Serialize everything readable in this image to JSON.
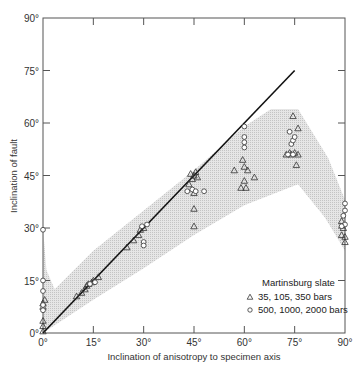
{
  "chart_data": {
    "type": "scatter",
    "title": "",
    "xlabel": "Inclination of anisotropy to specimen axis",
    "ylabel": "Inclination of fault",
    "xlim": [
      0,
      90
    ],
    "ylim": [
      0,
      90
    ],
    "grid": false,
    "x_ticks": [
      "0°",
      "15°",
      "30°",
      "45°",
      "60°",
      "75°",
      "90°"
    ],
    "y_ticks": [
      "0°",
      "15°",
      "30°",
      "45°",
      "60°",
      "75°",
      "90°"
    ],
    "legend": {
      "title": "Martinsburg slate",
      "position": "lower right",
      "entries": [
        {
          "marker": "triangle",
          "label": "35, 105, 350 bars"
        },
        {
          "marker": "circle",
          "label": "500, 1000, 2000 bars"
        }
      ]
    },
    "reference_line": {
      "name": "fault = anisotropy",
      "x": [
        0,
        75
      ],
      "y": [
        0,
        75
      ]
    },
    "shaded_band": {
      "upper": [
        [
          0,
          30
        ],
        [
          1,
          18
        ],
        [
          3.5,
          12.5
        ],
        [
          15,
          23.5
        ],
        [
          30,
          35
        ],
        [
          45,
          46.5
        ],
        [
          60,
          59
        ],
        [
          68,
          64
        ],
        [
          76,
          64
        ],
        [
          85,
          50
        ],
        [
          90,
          38
        ]
      ],
      "lower": [
        [
          90,
          23.5
        ],
        [
          84,
          33
        ],
        [
          76,
          42.5
        ],
        [
          60,
          36.5
        ],
        [
          45,
          28
        ],
        [
          30,
          18.5
        ],
        [
          15,
          9.5
        ],
        [
          0,
          0
        ]
      ]
    },
    "series": [
      {
        "name": "35, 105, 350 bars",
        "marker": "triangle",
        "points": [
          [
            0,
            0.5
          ],
          [
            0,
            2
          ],
          [
            0,
            3.5
          ],
          [
            0,
            7.5
          ],
          [
            0,
            8.5
          ],
          [
            0.5,
            9.5
          ],
          [
            10,
            10.5
          ],
          [
            11.5,
            11.5
          ],
          [
            12.5,
            12.5
          ],
          [
            13,
            13.5
          ],
          [
            13.5,
            14
          ],
          [
            14.5,
            14.5
          ],
          [
            15,
            15
          ],
          [
            16.5,
            16
          ],
          [
            25,
            24.5
          ],
          [
            27,
            26.5
          ],
          [
            28.5,
            28
          ],
          [
            29,
            29.5
          ],
          [
            30,
            30
          ],
          [
            43.5,
            42.5
          ],
          [
            44.5,
            44
          ],
          [
            45,
            45
          ],
          [
            45.5,
            46
          ],
          [
            46,
            44.5
          ],
          [
            44,
            45.5
          ],
          [
            45,
            40
          ],
          [
            45,
            35.5
          ],
          [
            45,
            30.5
          ],
          [
            57,
            46.5
          ],
          [
            59.5,
            49.5
          ],
          [
            60,
            47.5
          ],
          [
            61,
            46.5
          ],
          [
            63,
            44.5
          ],
          [
            60,
            43.5
          ],
          [
            59,
            41.5
          ],
          [
            60.5,
            41.5
          ],
          [
            72.5,
            51
          ],
          [
            73.5,
            51.5
          ],
          [
            74,
            51
          ],
          [
            75,
            51.5
          ],
          [
            76,
            51
          ],
          [
            76,
            58.5
          ],
          [
            74.5,
            62
          ],
          [
            75.5,
            48
          ],
          [
            89,
            28
          ],
          [
            89.5,
            30
          ],
          [
            90,
            27.5
          ],
          [
            89,
            32
          ],
          [
            90,
            26
          ]
        ]
      },
      {
        "name": "500, 1000, 2000 bars",
        "marker": "circle",
        "points": [
          [
            0,
            29.5
          ],
          [
            0,
            15
          ],
          [
            0,
            12
          ],
          [
            0,
            8
          ],
          [
            0,
            6.5
          ],
          [
            14,
            14
          ],
          [
            15.5,
            14.5
          ],
          [
            29.5,
            30.5
          ],
          [
            30,
            26
          ],
          [
            30,
            25
          ],
          [
            31,
            31
          ],
          [
            43,
            40.5
          ],
          [
            44.5,
            41
          ],
          [
            45.5,
            40.5
          ],
          [
            48,
            40.5
          ],
          [
            60,
            59
          ],
          [
            60,
            56
          ],
          [
            60,
            54.5
          ],
          [
            60,
            53
          ],
          [
            73,
            51
          ],
          [
            74,
            54
          ],
          [
            74.5,
            55
          ],
          [
            75,
            56
          ],
          [
            73.5,
            57.5
          ],
          [
            74.5,
            51
          ],
          [
            90,
            37
          ],
          [
            90,
            35
          ],
          [
            89.5,
            33.5
          ],
          [
            90,
            31
          ],
          [
            89,
            30.5
          ]
        ]
      }
    ]
  }
}
